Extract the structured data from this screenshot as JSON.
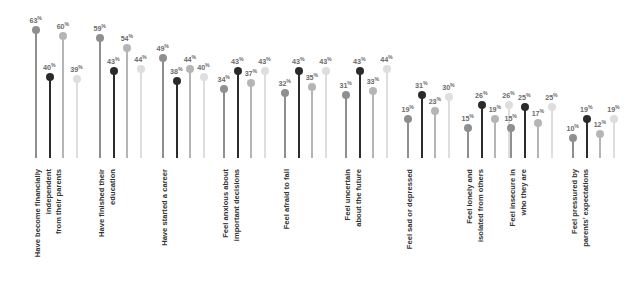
{
  "chart_data": {
    "type": "bar",
    "subtype": "lollipop",
    "title": "",
    "subtitle": "",
    "xlabel": "",
    "ylabel": "",
    "ylim": [
      0,
      70
    ],
    "grid": false,
    "legend": "none",
    "value_suffix": "%",
    "categories": [
      "Have become financially\nindependent\nfrom their parents",
      "Have finished their\neducation",
      "Have started a career",
      "Feel anxious about\nimportant decisions",
      "Feel afraid to fail",
      "Feel uncertain\nabout the future",
      "Feel sad or depressed",
      "Feel lonely and\nisolated from others",
      "Feel insecure in\nwho they are",
      "Feel pressured by\nparents' expectations"
    ],
    "series": [
      {
        "name": "series-1",
        "color": "#8f8f8f",
        "values": [
          63,
          59,
          49,
          34,
          32,
          31,
          19,
          15,
          15,
          10
        ],
        "labels": [
          "63",
          "59",
          "49",
          "34",
          "32",
          "31",
          "19",
          "15",
          "15",
          "10"
        ]
      },
      {
        "name": "series-2",
        "color": "#2b2b2b",
        "values": [
          40,
          43,
          38,
          43,
          43,
          43,
          31,
          26,
          25,
          19
        ],
        "labels": [
          "40",
          "43",
          "38",
          "43",
          "43",
          "43",
          "31",
          "26",
          "25",
          "19"
        ]
      },
      {
        "name": "series-3",
        "color": "#b5b5b5",
        "values": [
          60,
          54,
          44,
          37,
          35,
          33,
          23,
          19,
          17,
          12
        ],
        "labels": [
          "60",
          "54",
          "44",
          "37",
          "35",
          "33",
          "23",
          "19",
          "17",
          "12"
        ]
      },
      {
        "name": "series-4",
        "color": "#dedede",
        "values": [
          39,
          44,
          40,
          43,
          43,
          44,
          30,
          26,
          25,
          19
        ],
        "labels": [
          "39",
          "44",
          "40",
          "43",
          "43",
          "44",
          "30",
          "26",
          "25",
          "19"
        ]
      }
    ]
  }
}
